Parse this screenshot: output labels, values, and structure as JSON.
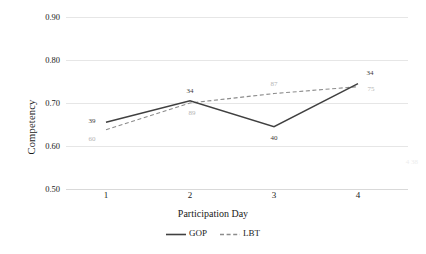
{
  "chart_data": {
    "type": "line",
    "title": "",
    "xlabel": "Participation Day",
    "ylabel": "Competency",
    "categories": [
      "1",
      "2",
      "3",
      "4"
    ],
    "x": [
      1,
      2,
      3,
      4
    ],
    "ylim": [
      0.5,
      0.9
    ],
    "yticks": [
      "0.50",
      "0.60",
      "0.70",
      "0.80",
      "0.90"
    ],
    "ytick_values": [
      0.5,
      0.6,
      0.7,
      0.8,
      0.9
    ],
    "xticks": [
      "1",
      "2",
      "3",
      "4"
    ],
    "grid": "horizontal",
    "legend_position": "bottom-center",
    "series": [
      {
        "name": "GOP",
        "style": "solid",
        "color": "#404040",
        "values": [
          0.655,
          0.705,
          0.645,
          0.745
        ],
        "point_labels": [
          "39",
          "34",
          "40",
          "34"
        ]
      },
      {
        "name": "LBT",
        "style": "dashed",
        "color": "#8c8c8c",
        "values": [
          0.638,
          0.7,
          0.722,
          0.738
        ],
        "point_labels": [
          "60",
          "89",
          "87",
          "75"
        ]
      }
    ]
  },
  "axes": {
    "y_title": "Competency",
    "x_title": "Participation Day"
  },
  "legend": {
    "items": [
      {
        "label": "GOP"
      },
      {
        "label": "LBT"
      }
    ]
  },
  "artifacts": {
    "edge_smudge": "4\n38"
  }
}
